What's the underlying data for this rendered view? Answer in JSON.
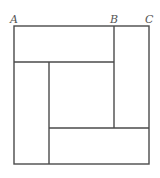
{
  "diagram": {
    "labels": [
      {
        "text": "A",
        "x": 10,
        "y": 23
      },
      {
        "text": "B",
        "x": 111,
        "y": 23
      },
      {
        "text": "C",
        "x": 146,
        "y": 23
      }
    ],
    "colors": {
      "line": "#4a4a4a",
      "label": "#555555",
      "background": "#ffffff"
    }
  }
}
